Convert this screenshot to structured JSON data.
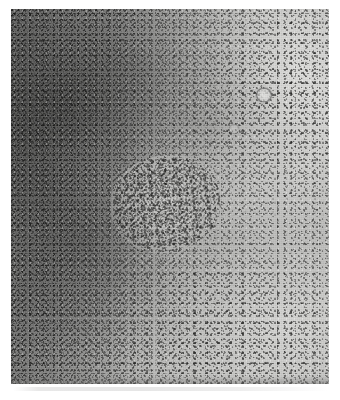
{
  "page": {
    "background_color": "#ffffff",
    "width": 340,
    "height": 400
  },
  "figure": {
    "kind": "histopathology-micrograph",
    "modality": "light-microscopy",
    "stain_appearance": "grayscale",
    "caption": "",
    "plate": {
      "x": 11,
      "y": 9,
      "width": 318,
      "height": 375,
      "border": "none",
      "mean_tone": "#9e9e9d",
      "darkest_tone": "#4a4a49",
      "lightest_tone": "#e2e2e0"
    },
    "regions": [
      {
        "name": "dense-dark-stroma-left",
        "description": "Dark densely cellular fibrous tissue occupying the left third and upper-left quadrant, with streaky collagen fibre bundles running obliquely.",
        "tone": "#5e5e5d",
        "position": "left"
      },
      {
        "name": "pale-field-upper-right",
        "description": "Bright pale tissue field in the upper-right quadrant with scattered small dark nuclei.",
        "tone": "#d8d8d6",
        "position": "upper-right"
      },
      {
        "name": "pale-field-lower",
        "description": "Pale lower and lower-right field with clustered dark nuclei aggregates.",
        "tone": "#cdcdcb",
        "position": "bottom"
      },
      {
        "name": "central-whorled-nodule",
        "description": "Central pale nodular lesion with concentric whorled fibrous architecture rimmed by dense dark nuclei.",
        "tone": "#c9c9c7",
        "position": "center"
      },
      {
        "name": "vessel-cross-section",
        "description": "Small round vessel profile with a pale lumen and dark wall in the upper-right field.",
        "tone": "#e0e0de",
        "position": "upper-right"
      },
      {
        "name": "bottom-scanner-streak",
        "description": "Faint horizontal gray artifact band along the lower margin of the plate.",
        "tone": "#b8b8b8",
        "position": "bottom-edge"
      }
    ],
    "annotations": [],
    "scale_bar": null,
    "labels": []
  }
}
